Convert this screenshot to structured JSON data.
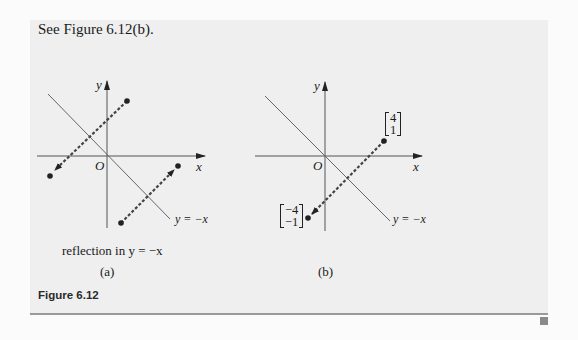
{
  "intro_text": "See Figure 6.12(b).",
  "figure": {
    "title": "Figure 6.12",
    "panel_a": {
      "y_axis_label": "y",
      "x_axis_label": "x",
      "origin_label": "O",
      "line_label": "y = −x",
      "description": "reflection in y = −x",
      "sublabel": "(a)"
    },
    "panel_b": {
      "y_axis_label": "y",
      "x_axis_label": "x",
      "origin_label": "O",
      "line_label": "y = −x",
      "sublabel": "(b)",
      "point_original": {
        "top": "4",
        "bottom": "1"
      },
      "point_reflected": {
        "top": "−4",
        "bottom": "−1"
      }
    }
  },
  "colors": {
    "panel_bg": "#efefef",
    "line": "#555555",
    "dashed": "#444444",
    "end_marker": "#8a8a8a"
  }
}
